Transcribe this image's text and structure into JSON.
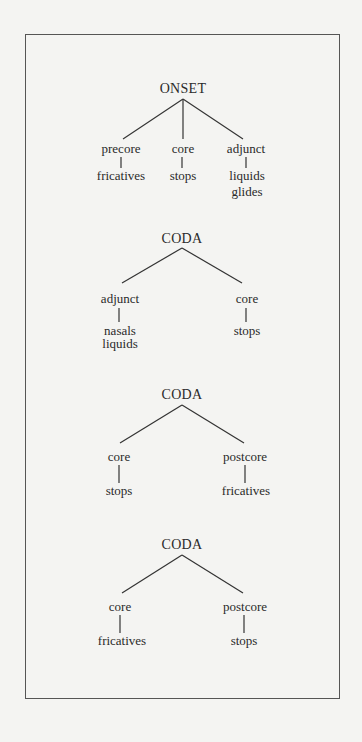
{
  "diagram": {
    "trees": [
      {
        "root": "ONSET",
        "children": [
          {
            "label": "precore",
            "members": [
              "fricatives"
            ]
          },
          {
            "label": "core",
            "members": [
              "stops"
            ]
          },
          {
            "label": "adjunct",
            "members": [
              "liquids",
              "glides"
            ]
          }
        ]
      },
      {
        "root": "CODA",
        "children": [
          {
            "label": "adjunct",
            "members": [
              "nasals",
              "liquids"
            ]
          },
          {
            "label": "core",
            "members": [
              "stops"
            ]
          }
        ]
      },
      {
        "root": "CODA",
        "children": [
          {
            "label": "core",
            "members": [
              "stops"
            ]
          },
          {
            "label": "postcore",
            "members": [
              "fricatives"
            ]
          }
        ]
      },
      {
        "root": "CODA",
        "children": [
          {
            "label": "core",
            "members": [
              "fricatives"
            ]
          },
          {
            "label": "postcore",
            "members": [
              "stops"
            ]
          }
        ]
      }
    ]
  }
}
